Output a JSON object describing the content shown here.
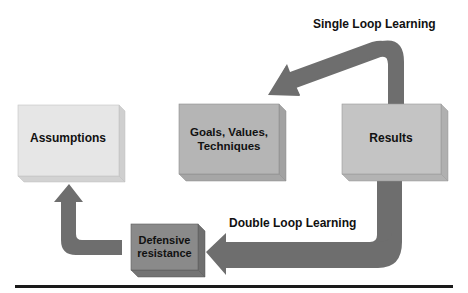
{
  "diagram": {
    "boxes": {
      "assumptions": {
        "label": "Assumptions",
        "color": "#e6e6e6"
      },
      "goals": {
        "line1": "Goals, Values,",
        "line2": "Techniques",
        "color": "#b5b5b5"
      },
      "results": {
        "label": "Results",
        "color": "#c4c4c4"
      },
      "defensive": {
        "line1": "Defensive",
        "line2": "resistance",
        "color": "#8a8a8a"
      }
    },
    "labels": {
      "single_loop": "Single Loop Learning",
      "double_loop": "Double Loop Learning"
    },
    "colors": {
      "arrow": "#6e6e6e",
      "rule": "#1a1a1a"
    }
  }
}
